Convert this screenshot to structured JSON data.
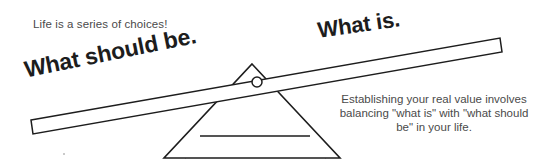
{
  "figure": {
    "background_color": "#ffffff",
    "ink_color": "#1d1d1d",
    "text_color": "#4a4a4a"
  },
  "caption": {
    "text": "Life is a series of choices!"
  },
  "labels": {
    "left_beam_label": "What should be.",
    "right_beam_label": "What is."
  },
  "paragraph": {
    "text": "Establishing your real value involves balancing \"what is\" with \"what should be\" in your life.",
    "lines": [
      "Establishing your real",
      "value involves balancing",
      "\"what is\" with \"what should",
      "be\" in your life."
    ]
  },
  "diagram": {
    "type": "seesaw-balance",
    "beam": {
      "name": "tilted-plank",
      "left_end_y": 127,
      "right_end_y": 45,
      "tilt_description": "left side down, right side up"
    },
    "fulcrum": {
      "name": "triangle-fulcrum",
      "apex_x": 252,
      "apex_y": 64,
      "has_pivot_circle": true
    },
    "pivot": {
      "name": "pivot-circle",
      "cx": 257,
      "cy": 82,
      "r": 5
    }
  }
}
